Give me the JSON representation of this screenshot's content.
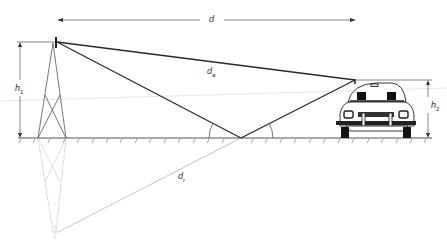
{
  "diagram": {
    "labels": {
      "distance": "d",
      "direct_path": "d",
      "direct_path_sub": "a",
      "reflected_path": "d",
      "reflected_path_sub": "r",
      "tx_height": "h",
      "tx_height_sub": "1",
      "rx_height": "h",
      "rx_height_sub": "2"
    },
    "elements": {
      "transmitter": "transmitter-tower",
      "receiver": "car",
      "ground": "ground-plane",
      "image_source": "mirrored-tower-image"
    },
    "colors": {
      "stroke": "#333333",
      "ray": "#2a2a2a",
      "dotted": "#888888",
      "faint_line": "#e6e6e6",
      "background": "#ffffff"
    }
  }
}
